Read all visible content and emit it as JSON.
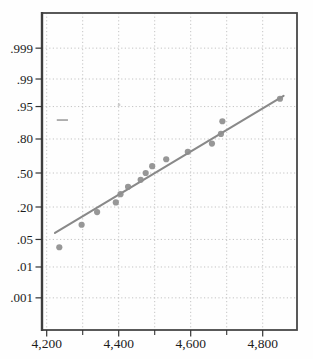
{
  "figure": {
    "kind": "normal-probability-plot",
    "background": "#fefefe"
  },
  "chart_data": {
    "type": "scatter",
    "subtype": "normal-probability-plot",
    "title": "",
    "xlabel": "",
    "ylabel": "",
    "grid": "dotted",
    "legend": "none",
    "xlim": [
      4187,
      4895
    ],
    "y_scale": "normal-quantile",
    "ylim_z": [
      -3.89,
      3.96
    ],
    "x_ticks": {
      "major": [
        {
          "value": 4200,
          "label": "4,200"
        },
        {
          "value": 4400,
          "label": "4,400"
        },
        {
          "value": 4600,
          "label": "4,600"
        },
        {
          "value": 4800,
          "label": "4,800"
        }
      ],
      "minor": [
        4300,
        4500,
        4700
      ],
      "gridline_values": [
        4200,
        4300,
        4400,
        4500,
        4600,
        4700,
        4800
      ]
    },
    "y_ticks": [
      {
        "p": 0.999,
        "label": ".999"
      },
      {
        "p": 0.99,
        "label": ".99"
      },
      {
        "p": 0.95,
        "label": ".95"
      },
      {
        "p": 0.8,
        "label": ".80"
      },
      {
        "p": 0.5,
        "label": ".50"
      },
      {
        "p": 0.2,
        "label": ".20"
      },
      {
        "p": 0.05,
        "label": ".05"
      },
      {
        "p": 0.01,
        "label": ".01"
      },
      {
        "p": 0.001,
        "label": ".001"
      }
    ],
    "points": [
      {
        "x": 4235,
        "p": 0.033
      },
      {
        "x": 4297,
        "p": 0.1
      },
      {
        "x": 4340,
        "p": 0.167
      },
      {
        "x": 4392,
        "p": 0.233
      },
      {
        "x": 4405,
        "p": 0.3
      },
      {
        "x": 4426,
        "p": 0.367
      },
      {
        "x": 4461,
        "p": 0.433
      },
      {
        "x": 4475,
        "p": 0.5
      },
      {
        "x": 4493,
        "p": 0.567
      },
      {
        "x": 4532,
        "p": 0.633
      },
      {
        "x": 4592,
        "p": 0.7
      },
      {
        "x": 4659,
        "p": 0.767
      },
      {
        "x": 4684,
        "p": 0.833
      },
      {
        "x": 4688,
        "p": 0.9
      },
      {
        "x": 4848,
        "p": 0.967
      }
    ],
    "fit_line": {
      "x1": 4223,
      "p1": 0.069,
      "x2": 4858,
      "p2": 0.972
    },
    "artifacts": [
      {
        "kind": "dash",
        "x1": 4228,
        "x2": 4259,
        "p": 0.905
      },
      {
        "kind": "speck",
        "x": 4401,
        "p": 0.954
      }
    ],
    "colors": {
      "point": "#8e8e8e",
      "fit_line": "#898989",
      "gridline": "#bdbdbd",
      "frame": "#474747",
      "axis": "#3d3d3d",
      "tick": "#333333",
      "label": "#1c1c1c",
      "artifact": "#9a9a9a"
    }
  }
}
